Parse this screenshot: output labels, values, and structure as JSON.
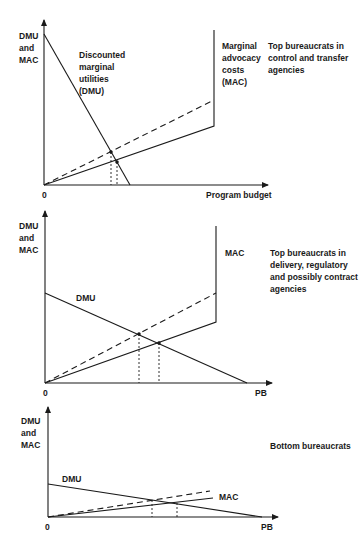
{
  "panels": [
    {
      "id": "top",
      "y_axis_label": [
        "DMU",
        "and",
        "MAC"
      ],
      "origin_label": "0",
      "x_axis_label": "Program budget",
      "dmu_label": [
        "Discounted",
        "marginal",
        "utilities",
        "(DMU)"
      ],
      "mac_label": [
        "Marginal",
        "advocacy",
        "costs",
        "(MAC)"
      ],
      "caption": [
        "Top bureaucrats in",
        "control and transfer",
        "agencies"
      ]
    },
    {
      "id": "middle",
      "y_axis_label": [
        "DMU",
        "and",
        "MAC"
      ],
      "origin_label": "0",
      "x_axis_label": "PB",
      "dmu_label": [
        "DMU"
      ],
      "mac_label": [
        "MAC"
      ],
      "caption": [
        "Top bureaucrats in",
        "delivery, regulatory",
        "and possibly contract",
        "agencies"
      ]
    },
    {
      "id": "bottom",
      "y_axis_label": [
        "DMU",
        "and",
        "MAC"
      ],
      "origin_label": "0",
      "x_axis_label": "PB",
      "dmu_label": [
        "DMU"
      ],
      "mac_label": [
        "MAC"
      ],
      "caption": [
        "Bottom bureaucrats"
      ]
    }
  ],
  "colors": {
    "ink": "#1a1a1a",
    "background": "#ffffff"
  }
}
